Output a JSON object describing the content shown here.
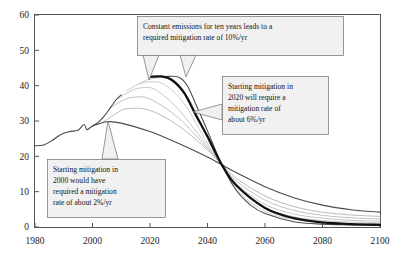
{
  "chart_data": {
    "type": "line",
    "title": "",
    "subtitle": "",
    "xlabel": "",
    "ylabel": "",
    "xlim": [
      1980,
      2100
    ],
    "ylim": [
      0,
      60
    ],
    "xticks": [
      1980,
      2000,
      2020,
      2040,
      2060,
      2080,
      2100
    ],
    "yticks": [
      0,
      10,
      20,
      30,
      40,
      50,
      60
    ],
    "grid": false,
    "legend": "none",
    "axis_frame": "box",
    "units_note": "Emissions (GtCO2/yr)",
    "series": [
      {
        "name": "historical-emissions",
        "emphasis": "normal",
        "color": "#4a4a4a",
        "width": 1.1,
        "x": [
          1980,
          1983,
          1986,
          1989,
          1992,
          1995,
          1997,
          1998,
          1999,
          2000,
          2002,
          2004,
          2006,
          2008,
          2010
        ],
        "values": [
          23.0,
          23.2,
          24.5,
          26.2,
          27.0,
          27.4,
          29.0,
          27.6,
          28.0,
          28.6,
          29.6,
          31.3,
          33.5,
          35.8,
          37.4
        ]
      },
      {
        "name": "mitigation-from-2000-at-2pct",
        "emphasis": "normal",
        "color": "#4a4a4a",
        "width": 1.1,
        "peak_year": 2005,
        "peak_value": 29.8,
        "mitigation_rate_pct": 2,
        "x": [
          2000,
          2005,
          2010,
          2020,
          2030,
          2040,
          2045,
          2050,
          2060,
          2070,
          2080,
          2090,
          2100
        ],
        "values": [
          28.6,
          29.8,
          29.4,
          27.0,
          23.6,
          19.8,
          17.6,
          15.4,
          11.4,
          8.3,
          6.2,
          4.9,
          4.2
        ]
      },
      {
        "name": "mitigation-from-2003",
        "emphasis": "light",
        "color": "#a8a8a8",
        "width": 0.8,
        "x": [
          2003,
          2008,
          2012,
          2020,
          2030,
          2040,
          2045,
          2050,
          2060,
          2070,
          2080,
          2090,
          2100
        ],
        "values": [
          29.3,
          32.0,
          33.5,
          33.0,
          28.6,
          21.8,
          17.6,
          13.8,
          8.8,
          5.8,
          4.2,
          3.4,
          3.0
        ]
      },
      {
        "name": "mitigation-from-2006",
        "emphasis": "light",
        "color": "#b0b0b0",
        "width": 0.8,
        "x": [
          2006,
          2010,
          2014,
          2020,
          2030,
          2040,
          2045,
          2050,
          2060,
          2070,
          2080,
          2090,
          2100
        ],
        "values": [
          33.5,
          35.6,
          36.7,
          36.2,
          30.8,
          22.2,
          17.6,
          13.0,
          7.6,
          4.7,
          3.3,
          2.6,
          2.3
        ]
      },
      {
        "name": "mitigation-from-2009",
        "emphasis": "light",
        "color": "#b8b8b8",
        "width": 0.8,
        "x": [
          2009,
          2013,
          2017,
          2022,
          2030,
          2040,
          2045,
          2050,
          2060,
          2070,
          2080,
          2090,
          2100
        ],
        "values": [
          36.3,
          38.4,
          39.4,
          38.8,
          33.2,
          22.8,
          17.6,
          12.2,
          6.4,
          3.7,
          2.5,
          1.9,
          1.7
        ]
      },
      {
        "name": "mitigation-from-2012",
        "emphasis": "light",
        "color": "#bdbdbd",
        "width": 0.8,
        "x": [
          2012,
          2016,
          2020,
          2025,
          2032,
          2040,
          2045,
          2050,
          2060,
          2070,
          2080,
          2090,
          2100
        ],
        "values": [
          38.6,
          40.4,
          41.1,
          40.3,
          34.8,
          23.6,
          17.6,
          11.4,
          5.4,
          2.9,
          1.8,
          1.4,
          1.2
        ]
      },
      {
        "name": "mitigation-from-2016",
        "emphasis": "light",
        "color": "#c2c2c2",
        "width": 0.8,
        "x": [
          2016,
          2019,
          2023,
          2027,
          2034,
          2040,
          2045,
          2050,
          2060,
          2070,
          2080,
          2090,
          2100
        ],
        "values": [
          40.5,
          41.6,
          42.2,
          41.6,
          35.6,
          25.0,
          17.6,
          10.6,
          4.4,
          2.2,
          1.3,
          1.0,
          0.9
        ]
      },
      {
        "name": "mitigation-from-2020-at-6pct",
        "emphasis": "bold",
        "color": "#111111",
        "width": 2.3,
        "peak_year": 2021,
        "peak_value": 42.6,
        "mitigation_rate_pct": 6,
        "x": [
          2020,
          2024,
          2028,
          2032,
          2036,
          2040,
          2045,
          2050,
          2060,
          2070,
          2080,
          2090,
          2100
        ],
        "values": [
          42.5,
          42.6,
          41.4,
          37.8,
          31.6,
          25.6,
          17.6,
          11.8,
          5.4,
          2.5,
          1.3,
          0.8,
          0.6
        ]
      },
      {
        "name": "constant-emissions-ten-years-at-10pct",
        "emphasis": "normal",
        "color": "#4f4f4f",
        "width": 1.1,
        "peak_year": 2030,
        "peak_value": 42.6,
        "mitigation_rate_pct": 10,
        "x": [
          2020,
          2025,
          2030,
          2033,
          2036,
          2040,
          2045,
          2050,
          2055,
          2060,
          2070,
          2080,
          2090,
          2100
        ],
        "values": [
          42.5,
          42.6,
          42.4,
          40.0,
          34.6,
          27.2,
          17.6,
          10.4,
          6.2,
          3.8,
          1.5,
          0.8,
          0.6,
          0.5
        ]
      }
    ],
    "annotations": [
      {
        "id": "annotation-constant-emissions",
        "lines": [
          "Constant emissions for ten years leads to a",
          "required mitigation rate of 10%/yr"
        ],
        "mitigation_rate_pct": 10,
        "box": {
          "x": 137,
          "y": 16,
          "w": 206,
          "h": 39
        },
        "pointers": [
          {
            "to_x": 149,
            "to_y": 80
          },
          {
            "to_x": 186,
            "to_y": 77
          }
        ]
      },
      {
        "id": "annotation-start-2020",
        "lines": [
          "Starting mitigation in",
          "2020 will require a",
          "mitigation rate of",
          "about 6%/yr"
        ],
        "mitigation_rate_pct": 6,
        "box": {
          "x": 222,
          "y": 76,
          "w": 106,
          "h": 58
        },
        "pointers": [
          {
            "to_x": 193,
            "to_y": 112
          }
        ]
      },
      {
        "id": "annotation-start-2000",
        "lines": [
          "Starting mitigation in",
          "2000 would have",
          "required a mitigation",
          "rate of about 2%/yr"
        ],
        "mitigation_rate_pct": 2,
        "box": {
          "x": 47,
          "y": 159,
          "w": 118,
          "h": 58
        },
        "pointers": [
          {
            "to_x": 108,
            "to_y": 121
          }
        ]
      }
    ]
  },
  "colors": {
    "axis": "#555555",
    "bold_curve": "#111111",
    "normal_curve": "#4a4a4a",
    "light_curve": "#b8b8b8",
    "annotation_fill": "#f0f0f0",
    "annotation_border": "#6d6d6d",
    "background": "#ffffff"
  }
}
